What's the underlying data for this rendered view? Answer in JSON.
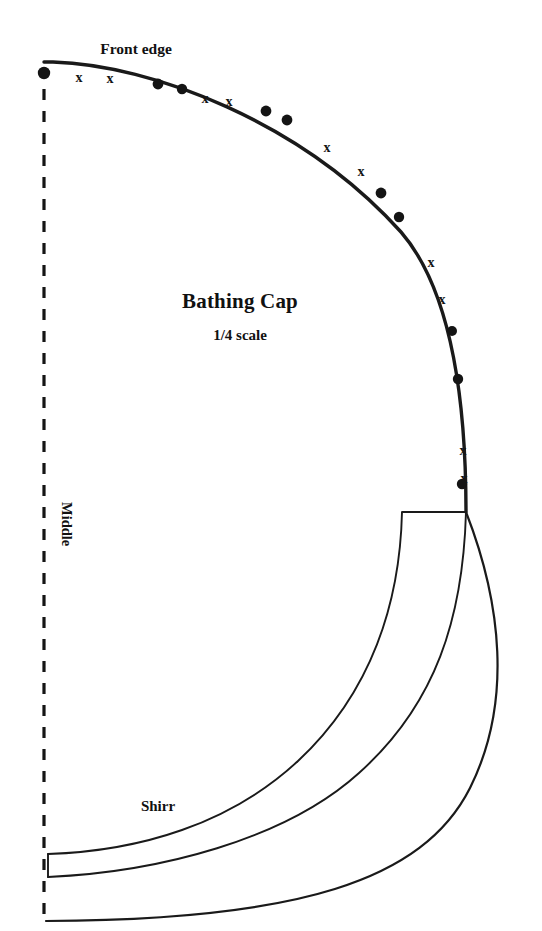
{
  "document": {
    "type": "sewing-pattern-diagram",
    "background_color": "#ffffff",
    "ink_color": "#1a1a1a",
    "width": 542,
    "height": 931
  },
  "title": {
    "main": "Bathing Cap",
    "subtitle": "1/4 scale"
  },
  "labels": {
    "front_edge": "Front edge",
    "middle": "Middle",
    "shirr": "Shirr"
  },
  "notation": {
    "dot_symbol": "●",
    "x_symbol": "x",
    "legend_note": "alternating pairs of dots and x marks along front edge"
  },
  "marks": {
    "dots": [
      {
        "x": 44,
        "y": 73
      },
      {
        "x": 158,
        "y": 84
      },
      {
        "x": 182,
        "y": 89
      },
      {
        "x": 266,
        "y": 111
      },
      {
        "x": 287,
        "y": 120
      },
      {
        "x": 381,
        "y": 193
      },
      {
        "x": 399,
        "y": 217
      },
      {
        "x": 452,
        "y": 331
      },
      {
        "x": 458,
        "y": 379
      },
      {
        "x": 462,
        "y": 484
      }
    ],
    "crosses": [
      {
        "x": 79,
        "y": 77
      },
      {
        "x": 110,
        "y": 78
      },
      {
        "x": 205,
        "y": 98
      },
      {
        "x": 229,
        "y": 101
      },
      {
        "x": 327,
        "y": 147
      },
      {
        "x": 361,
        "y": 171
      },
      {
        "x": 431,
        "y": 262
      },
      {
        "x": 442,
        "y": 299
      },
      {
        "x": 463,
        "y": 450
      },
      {
        "x": 464,
        "y": 478
      }
    ]
  },
  "geometry": {
    "fold_line": {
      "x": 44,
      "y_top": 67,
      "y_bottom": 918,
      "style": "dashed",
      "meaning": "center fold / middle"
    },
    "front_edge_curve": "M 44 62 L 52 62 C 150 64 300 120 400 230 C 452 288 466 400 466 512",
    "crown_to_band_notch": "M 466 512 L 466 512",
    "band_top": "M 466 512 L 402 512 C 399 600 374 690 300 760 C 232 824 140 852 48 855",
    "band_mid": "M 466 512 C 462 616 436 702 360 772 C 286 840 160 872 48 876",
    "band_outer": "M 466 512 C 500 600 512 700 470 786 C 424 880 300 920 92 928"
  },
  "style": {
    "stroke_heavy": 3.4,
    "stroke_medium": 2.2,
    "stroke_light": 1.9,
    "dot_radius": 5.2
  }
}
